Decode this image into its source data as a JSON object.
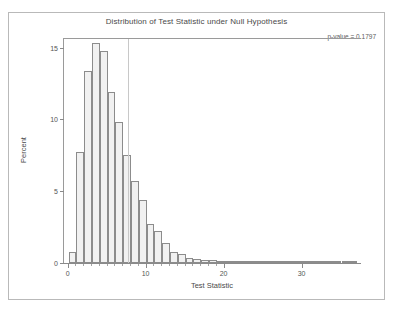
{
  "chart_data": {
    "type": "bar",
    "title": "Distribution of Test Statistic under Null Hypothesis",
    "xlabel": "Test Statistic",
    "ylabel": "Percent",
    "xlim": [
      -0.6,
      37.5
    ],
    "ylim": [
      0,
      15.6
    ],
    "xticks": [
      0,
      10,
      20,
      30
    ],
    "xtick_labels": [
      "0",
      "10",
      "20",
      "30"
    ],
    "yticks": [
      0,
      5,
      10,
      15
    ],
    "ytick_labels": [
      "0",
      "5",
      "10",
      "15"
    ],
    "grid": false,
    "legend": null,
    "bar_fill": "#f1f1f1",
    "bar_edge": "#8c8c8c",
    "bin_width": 1,
    "categories": [
      0,
      1,
      2,
      3,
      4,
      5,
      6,
      7,
      8,
      9,
      10,
      11,
      12,
      13,
      14,
      15,
      16,
      17,
      18,
      19,
      20,
      21,
      22,
      23,
      24,
      25,
      26,
      27,
      28,
      29,
      30,
      31,
      32,
      33,
      34,
      35,
      36
    ],
    "values": [
      0.8,
      7.7,
      13.4,
      15.3,
      14.8,
      11.9,
      9.8,
      7.5,
      5.7,
      4.4,
      2.7,
      2.2,
      1.4,
      0.8,
      0.6,
      0.35,
      0.3,
      0.22,
      0.18,
      0.1,
      0.07,
      0.05,
      0.04,
      0.03,
      0.02,
      0.02,
      0.02,
      0.01,
      0.01,
      0.01,
      0.01,
      0.01,
      0.01,
      0.01,
      0.01,
      0.01,
      0.01
    ],
    "annotations": [
      {
        "name": "p-value",
        "text": "p-value = 0.1797",
        "position": "top-right"
      }
    ],
    "reference_line": {
      "orientation": "vertical",
      "x": 7.6,
      "color": "#c8c8c8"
    }
  }
}
